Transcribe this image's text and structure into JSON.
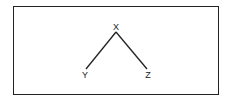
{
  "diagram": {
    "type": "tree",
    "nodes": [
      {
        "id": "X",
        "label": "X",
        "x": 116,
        "y": 27
      },
      {
        "id": "Y",
        "label": "Y",
        "x": 85,
        "y": 75
      },
      {
        "id": "Z",
        "label": "Z",
        "x": 148,
        "y": 75
      }
    ],
    "edges": [
      {
        "from": "X",
        "to": "Y"
      },
      {
        "from": "X",
        "to": "Z"
      }
    ],
    "colors": {
      "stroke": "#222222",
      "background": "#ffffff"
    }
  }
}
